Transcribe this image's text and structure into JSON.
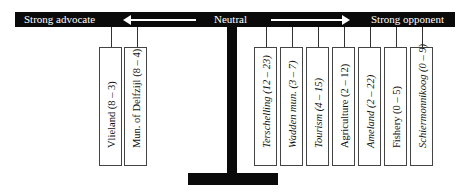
{
  "scale": {
    "left_label": "Strong advocate",
    "center_label": "Neutral",
    "right_label": "Strong opponent"
  },
  "advocates": [
    {
      "label": "Vlieland (8 – 3)",
      "italic": false
    },
    {
      "label": "Mun. of Delfzijl (8 – 4)",
      "italic": false
    }
  ],
  "opponents": [
    {
      "label": "Terschelling (12 – 23)",
      "italic": true
    },
    {
      "label": "Wadden mun. (3 – 7)",
      "italic": true
    },
    {
      "label": "Tourism (4 – 15)",
      "italic": true
    },
    {
      "label": "Agriculture (2 – 12)",
      "italic": false
    },
    {
      "label": "Ameland (2 – 22)",
      "italic": true
    },
    {
      "label": "Fishery (0 – 5)",
      "italic": false
    },
    {
      "label": "Schiermonnikoog (0 – 9)",
      "italic": true
    }
  ],
  "colors": {
    "bar": "#0a0a0a",
    "bar_text": "#ffffff",
    "box_border": "#444444"
  }
}
